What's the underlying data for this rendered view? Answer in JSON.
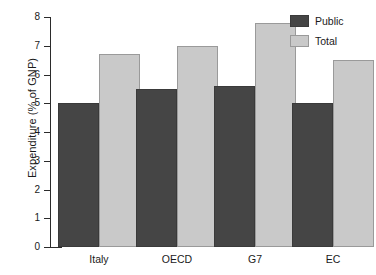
{
  "chart_data": {
    "type": "bar",
    "title": "",
    "subtitle": "",
    "xlabel": "",
    "ylabel": "Expenditure (% of GNP)",
    "categories": [
      "Italy",
      "OECD",
      "G7",
      "EC"
    ],
    "series": [
      {
        "name": "Public",
        "color": "#454545",
        "values": [
          5.0,
          5.5,
          5.6,
          5.0
        ]
      },
      {
        "name": "Total",
        "color": "#c9c9c9",
        "values": [
          6.7,
          7.0,
          7.8,
          6.5
        ]
      }
    ],
    "ylim": [
      0,
      8
    ],
    "ytick_labels": [
      "0",
      "1",
      "2",
      "3",
      "4",
      "5",
      "6",
      "7",
      "8"
    ],
    "ytick_values": [
      0,
      1,
      2,
      3,
      4,
      5,
      6,
      7,
      8
    ],
    "grid": false,
    "legend_position": "top-right",
    "legend_entries": [
      "Public",
      "Total"
    ]
  },
  "axis": {
    "y_title": "Expenditure (% of GNP)"
  }
}
